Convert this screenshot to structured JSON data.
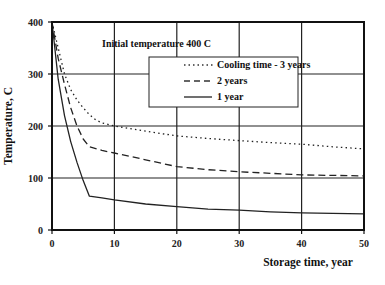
{
  "chart_data": {
    "type": "line",
    "title": "",
    "xlabel": "Storage time, year",
    "ylabel": "Temperature, C",
    "xlim": [
      0,
      50
    ],
    "ylim": [
      0,
      400
    ],
    "x_ticks": [
      0,
      10,
      20,
      30,
      40,
      50
    ],
    "y_ticks": [
      0,
      100,
      200,
      300,
      400
    ],
    "grid": true,
    "legend_position": "upper right (inside)",
    "annotations": [
      "Initial temperature 400 C"
    ],
    "series": [
      {
        "name": "Cooling time - 3 years",
        "style": "dotted",
        "x": [
          0,
          1,
          2,
          3,
          4,
          5,
          6,
          7,
          8,
          10,
          15,
          20,
          25,
          30,
          35,
          40,
          45,
          50
        ],
        "y": [
          400,
          350,
          300,
          270,
          250,
          235,
          222,
          212,
          206,
          200,
          190,
          181,
          176,
          172,
          168,
          165,
          160,
          156
        ]
      },
      {
        "name": "2 years",
        "style": "dashed",
        "x": [
          0,
          1,
          2,
          3,
          4,
          5,
          6,
          8,
          10,
          15,
          20,
          25,
          30,
          35,
          40,
          45,
          50
        ],
        "y": [
          400,
          330,
          280,
          235,
          200,
          175,
          160,
          153,
          148,
          135,
          122,
          116,
          112,
          109,
          106,
          105,
          104
        ]
      },
      {
        "name": "1 year",
        "style": "solid",
        "x": [
          0,
          1,
          2,
          3,
          4,
          5,
          6,
          8,
          10,
          15,
          20,
          25,
          30,
          35,
          40,
          45,
          50
        ],
        "y": [
          400,
          290,
          220,
          170,
          130,
          95,
          65,
          62,
          58,
          50,
          45,
          40,
          38,
          35,
          33,
          32,
          31
        ]
      }
    ]
  },
  "labels": {
    "annotation": "Initial temperature 400 C",
    "legend": [
      "Cooling time - 3 years",
      "2 years",
      "1 year"
    ]
  }
}
